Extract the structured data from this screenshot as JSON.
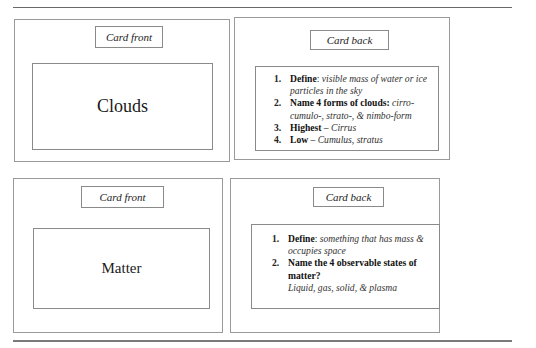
{
  "cards": [
    {
      "side_label": "Card front",
      "term": "Clouds"
    },
    {
      "side_label": "Card back",
      "items": [
        {
          "number": "1.",
          "question": "Define",
          "separator": ": ",
          "answer": "visible mass of water or ice particles in the sky"
        },
        {
          "number": "2.",
          "question": "Name 4 forms of clouds:",
          "separator": " ",
          "answer": "cirro-cumulo-, strato-, & nimbo-form"
        },
        {
          "number": "3.",
          "question": "Highest",
          "separator": " – ",
          "answer": "Cirrus"
        },
        {
          "number": "4.",
          "question": "Low",
          "separator": " – ",
          "answer": "Cumulus, stratus"
        }
      ]
    },
    {
      "side_label": "Card front",
      "term": "Matter"
    },
    {
      "side_label": "Card back",
      "items": [
        {
          "number": "1.",
          "question": "Define",
          "separator": ": ",
          "answer": "something that has mass & occupies space"
        },
        {
          "number": "2.",
          "question": "Name the 4 observable states of matter?",
          "separator": "",
          "answer": "Liquid, gas, solid, & plasma"
        }
      ]
    }
  ]
}
